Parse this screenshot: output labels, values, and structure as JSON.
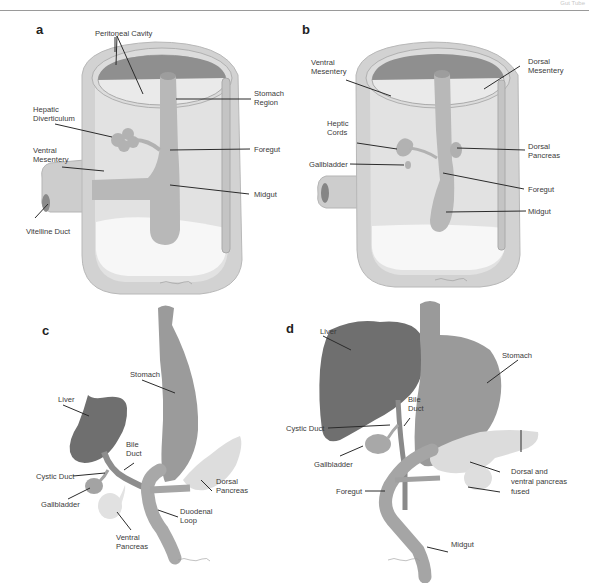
{
  "header": {
    "running_head": "Gut Tube"
  },
  "panels": {
    "a": {
      "letter": "a",
      "labels": {
        "peritoneal_cavity": "Peritoneal Cavity",
        "stomach_region_1": "Stomach",
        "stomach_region_2": "Region",
        "hepatic_diverticulum_1": "Hepatic",
        "hepatic_diverticulum_2": "Diverticulum",
        "ventral_mesentery_1": "Ventral",
        "ventral_mesentery_2": "Mesentery",
        "foregut": "Foregut",
        "midgut": "Midgut",
        "vitelline_duct": "Vitelline Duct"
      }
    },
    "b": {
      "letter": "b",
      "labels": {
        "ventral_mesentery_1": "Ventral",
        "ventral_mesentery_2": "Mesentery",
        "dorsal_mesentery_1": "Dorsal",
        "dorsal_mesentery_2": "Mesentery",
        "heptic_cords_1": "Heptic",
        "heptic_cords_2": "Cords",
        "gallbladder": "Gallbladder",
        "dorsal_pancreas_1": "Dorsal",
        "dorsal_pancreas_2": "Pancreas",
        "foregut": "Foregut",
        "midgut": "Midgut"
      }
    },
    "c": {
      "letter": "c",
      "labels": {
        "stomach": "Stomach",
        "liver": "Liver",
        "bile_duct_1": "Bile",
        "bile_duct_2": "Duct",
        "cystic_duct": "Cystic Duct",
        "gallbladder": "Gallbladder",
        "dorsal_pancreas_1": "Dorsal",
        "dorsal_pancreas_2": "Pancreas",
        "duodenal_loop_1": "Duodenal",
        "duodenal_loop_2": "Loop",
        "ventral_pancreas_1": "Ventral",
        "ventral_pancreas_2": "Pancreas"
      }
    },
    "d": {
      "letter": "d",
      "labels": {
        "liver": "Liver",
        "stomach": "Stomach",
        "bile_duct_1": "Bile",
        "bile_duct_2": "Duct",
        "cystic_duct": "Cystic Duct",
        "gallbladder": "Gallbladder",
        "fused_pancreas_1": "Dorsal and",
        "fused_pancreas_2": "ventral pancreas",
        "fused_pancreas_3": "fused",
        "foregut": "Foregut",
        "midgut": "Midgut"
      }
    }
  },
  "colors": {
    "wall_outer": "#cfcfcf",
    "wall_inner": "#e4e4e4",
    "cavity_dark": "#8e8e8e",
    "cavity_light": "#ececec",
    "gut": "#b9b9b9",
    "liver": "#707070",
    "stomach": "#9a9a9a",
    "pancreas": "#dcdcdc",
    "yolk": "#f6f6f6"
  }
}
